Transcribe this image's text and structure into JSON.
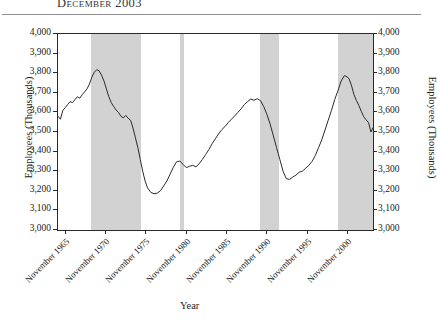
{
  "title": "December 2003",
  "axes": {
    "y_label_left": "Employees (Thousands)",
    "y_label_right": "Employees (Thousands)",
    "x_label": "Year"
  },
  "chart_data": {
    "type": "line",
    "title": "December 2003",
    "xlabel": "Year",
    "ylabel": "Employees (Thousands)",
    "ylim": [
      3000,
      4000
    ],
    "ytick_labels": [
      "4,000",
      "3,900",
      "3,800",
      "3,700",
      "3,600",
      "3,500",
      "3,400",
      "3,300",
      "3,200",
      "3,100",
      "3,000"
    ],
    "ytick_values": [
      4000,
      3900,
      3800,
      3700,
      3600,
      3500,
      3400,
      3300,
      3200,
      3100,
      3000
    ],
    "xtick_labels": [
      "November 1965",
      "November 1970",
      "November 1975",
      "November 1980",
      "November 1985",
      "November 1990",
      "November 1995",
      "November 2000"
    ],
    "xtick_values": [
      1965.87,
      1970.87,
      1975.87,
      1980.87,
      1985.87,
      1990.87,
      1995.87,
      2000.87
    ],
    "xlim": [
      1964.9,
      2003.95
    ],
    "grid": false,
    "legend": null,
    "line_color": "#2b2b2b",
    "band_color": "#d2d2d2",
    "shaded_bands": [
      {
        "start": 1969.0,
        "end": 1975.2
      },
      {
        "start": 1980.0,
        "end": 1980.55
      },
      {
        "start": 1989.9,
        "end": 1992.3
      },
      {
        "start": 1999.6,
        "end": 2003.95
      }
    ],
    "series": [
      {
        "name": "Employees (Thousands)",
        "x": [
          1964.9,
          1965.2,
          1965.5,
          1965.8,
          1966.1,
          1966.4,
          1966.7,
          1967.0,
          1967.3,
          1967.6,
          1967.9,
          1968.2,
          1968.5,
          1968.8,
          1969.1,
          1969.4,
          1969.7,
          1970.0,
          1970.3,
          1970.6,
          1970.9,
          1971.2,
          1971.5,
          1971.8,
          1972.1,
          1972.4,
          1972.7,
          1973.0,
          1973.3,
          1973.6,
          1973.9,
          1974.2,
          1974.5,
          1974.8,
          1975.1,
          1975.4,
          1975.7,
          1976.0,
          1976.4,
          1976.8,
          1977.2,
          1977.6,
          1978.0,
          1978.4,
          1978.8,
          1979.2,
          1979.6,
          1980.0,
          1980.4,
          1980.8,
          1981.2,
          1981.6,
          1982.0,
          1982.4,
          1982.8,
          1983.2,
          1983.6,
          1984.0,
          1984.4,
          1984.8,
          1985.2,
          1985.6,
          1986.0,
          1986.4,
          1986.8,
          1987.2,
          1987.6,
          1988.0,
          1988.4,
          1988.8,
          1989.2,
          1989.6,
          1990.0,
          1990.4,
          1990.8,
          1991.2,
          1991.6,
          1992.0,
          1992.4,
          1992.8,
          1993.2,
          1993.6,
          1994.0,
          1994.4,
          1994.8,
          1995.2,
          1995.6,
          1996.0,
          1996.4,
          1996.8,
          1997.2,
          1997.6,
          1998.0,
          1998.4,
          1998.8,
          1999.2,
          1999.6,
          2000.0,
          2000.4,
          2000.8,
          2001.0,
          2001.3,
          2001.6,
          2001.9,
          2002.2,
          2002.5,
          2002.8,
          2003.1,
          2003.4,
          2003.7,
          2003.95
        ],
        "y": [
          3580,
          3565,
          3610,
          3625,
          3640,
          3655,
          3650,
          3665,
          3680,
          3672,
          3690,
          3705,
          3720,
          3745,
          3780,
          3805,
          3818,
          3812,
          3790,
          3760,
          3720,
          3680,
          3650,
          3630,
          3612,
          3600,
          3580,
          3572,
          3585,
          3570,
          3560,
          3520,
          3470,
          3420,
          3360,
          3300,
          3250,
          3215,
          3192,
          3185,
          3188,
          3200,
          3225,
          3250,
          3285,
          3320,
          3348,
          3352,
          3335,
          3318,
          3325,
          3330,
          3322,
          3338,
          3360,
          3385,
          3410,
          3440,
          3465,
          3490,
          3512,
          3528,
          3548,
          3565,
          3582,
          3600,
          3618,
          3640,
          3655,
          3668,
          3662,
          3670,
          3660,
          3630,
          3590,
          3540,
          3480,
          3420,
          3360,
          3300,
          3262,
          3258,
          3270,
          3280,
          3295,
          3300,
          3315,
          3330,
          3350,
          3380,
          3420,
          3460,
          3510,
          3560,
          3610,
          3665,
          3710,
          3760,
          3788,
          3780,
          3770,
          3735,
          3690,
          3660,
          3635,
          3605,
          3578,
          3562,
          3548,
          3500,
          3522
        ]
      }
    ]
  },
  "y_ticks": [
    {
      "label": "4,000",
      "value": 4000
    },
    {
      "label": "3,900",
      "value": 3900
    },
    {
      "label": "3,800",
      "value": 3800
    },
    {
      "label": "3,700",
      "value": 3700
    },
    {
      "label": "3,600",
      "value": 3600
    },
    {
      "label": "3,500",
      "value": 3500
    },
    {
      "label": "3,400",
      "value": 3400
    },
    {
      "label": "3,300",
      "value": 3300
    },
    {
      "label": "3,200",
      "value": 3200
    },
    {
      "label": "3,100",
      "value": 3100
    },
    {
      "label": "3,000",
      "value": 3000
    }
  ],
  "x_ticks": [
    {
      "label": "November 1965",
      "value": 1965.87
    },
    {
      "label": "November 1970",
      "value": 1970.87
    },
    {
      "label": "November 1975",
      "value": 1975.87
    },
    {
      "label": "November 1980",
      "value": 1980.87
    },
    {
      "label": "November 1985",
      "value": 1985.87
    },
    {
      "label": "November 1990",
      "value": 1990.87
    },
    {
      "label": "November 1995",
      "value": 1995.87
    },
    {
      "label": "November 2000",
      "value": 2000.87
    }
  ]
}
